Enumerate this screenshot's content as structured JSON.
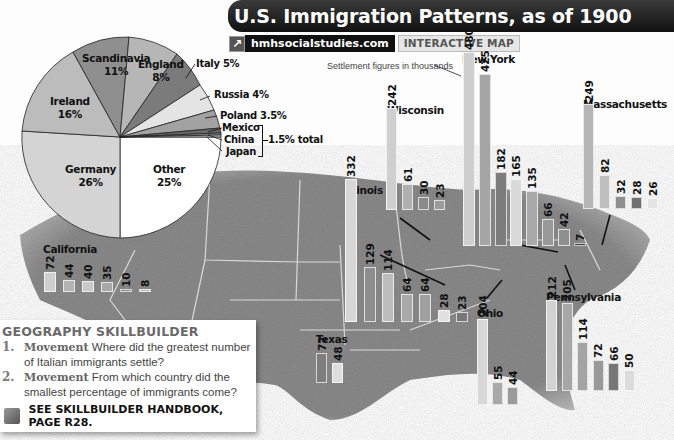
{
  "header": {
    "title": "U.S. Immigration Patterns, as of 1900",
    "web_link": "hmhsocialstudies.com",
    "web_tag": "INTERACTIVE MAP",
    "note": "Settlement figures in thousands"
  },
  "colors": {
    "scandinavia": "#8d8d8d",
    "england": "#b5b5b5",
    "italy": "#7a7a7a",
    "russia": "#e2e2e2",
    "poland": "#a0a0a0",
    "ireland": "#b9b9b9",
    "germany": "#d2d2d2",
    "other": "#ffffff",
    "small": "#6a6a6a"
  },
  "pie": {
    "labels": {
      "scandinavia": "Scandinavia",
      "scandinavia_pct": "11%",
      "england": "England",
      "england_pct": "8%",
      "italy": "Italy 5%",
      "russia": "Russia 4%",
      "poland": "Poland 3.5%",
      "mexico": "Mexico",
      "china": "China",
      "japan": "Japan",
      "combined": "1.5% total",
      "ireland": "Ireland",
      "ireland_pct": "16%",
      "germany": "Germany",
      "germany_pct": "26%",
      "other": "Other",
      "other_pct": "25%"
    }
  },
  "states": {
    "california": {
      "label": "California",
      "values": [
        "72",
        "44",
        "40",
        "35",
        "10",
        "8"
      ]
    },
    "illinois": {
      "label": "Illinois",
      "values": [
        "332",
        "129",
        "114",
        "64",
        "64",
        "28",
        "23"
      ]
    },
    "wisconsin": {
      "label": "Wisconsin",
      "values": [
        "242",
        "61",
        "30",
        "23"
      ]
    },
    "new_york": {
      "label": "New York",
      "values": [
        "480",
        "425",
        "182",
        "165",
        "135",
        "66",
        "42",
        "7"
      ]
    },
    "massachusetts": {
      "label": "Massachusetts",
      "values": [
        "249",
        "82",
        "32",
        "28",
        "26"
      ]
    },
    "texas": {
      "label": "Texas",
      "values": [
        "72",
        "48"
      ]
    },
    "ohio": {
      "label": "Ohio",
      "values": [
        "204",
        "55",
        "44"
      ]
    },
    "pennsylvania": {
      "label": "Pennsylvania",
      "values": [
        "212",
        "205",
        "114",
        "72",
        "66",
        "50"
      ]
    }
  },
  "skillbuilder": {
    "title": "GEOGRAPHY SKILLBUILDER",
    "q1_num": "1.",
    "q1_kw": "Movement",
    "q1_text": "Where did the greatest number of Italian immigrants settle?",
    "q2_num": "2.",
    "q2_kw": "Movement",
    "q2_text": "From which country did the smallest percentage of immigrants come?",
    "handbook": "SEE SKILLBUILDER HANDBOOK, PAGE R28."
  },
  "chart_data": [
    {
      "type": "pie",
      "title": "U.S. Immigration Patterns, as of 1900",
      "categories": [
        "Germany",
        "Ireland",
        "Scandinavia",
        "England",
        "Italy",
        "Russia",
        "Poland",
        "Mexico/China/Japan",
        "Other"
      ],
      "values": [
        26,
        16,
        11,
        8,
        5,
        4,
        3.5,
        1.5,
        25
      ],
      "unit": "%",
      "annotations": [
        "Mexico, China, Japan: 1.5% total"
      ]
    },
    {
      "type": "bar",
      "title": "Settlement figures in thousands",
      "series": [
        {
          "name": "California",
          "values": [
            72,
            44,
            40,
            35,
            10,
            8
          ]
        },
        {
          "name": "Illinois",
          "values": [
            332,
            129,
            114,
            64,
            64,
            28,
            23
          ]
        },
        {
          "name": "Wisconsin",
          "values": [
            242,
            61,
            30,
            23
          ]
        },
        {
          "name": "New York",
          "values": [
            480,
            425,
            182,
            165,
            135,
            66,
            42,
            7
          ]
        },
        {
          "name": "Massachusetts",
          "values": [
            249,
            82,
            32,
            28,
            26
          ]
        },
        {
          "name": "Texas",
          "values": [
            72,
            48
          ]
        },
        {
          "name": "Ohio",
          "values": [
            204,
            55,
            44
          ]
        },
        {
          "name": "Pennsylvania",
          "values": [
            212,
            205,
            114,
            72,
            66,
            50
          ]
        }
      ],
      "ylabel": "Settlers (thousands)",
      "grid": false
    }
  ]
}
